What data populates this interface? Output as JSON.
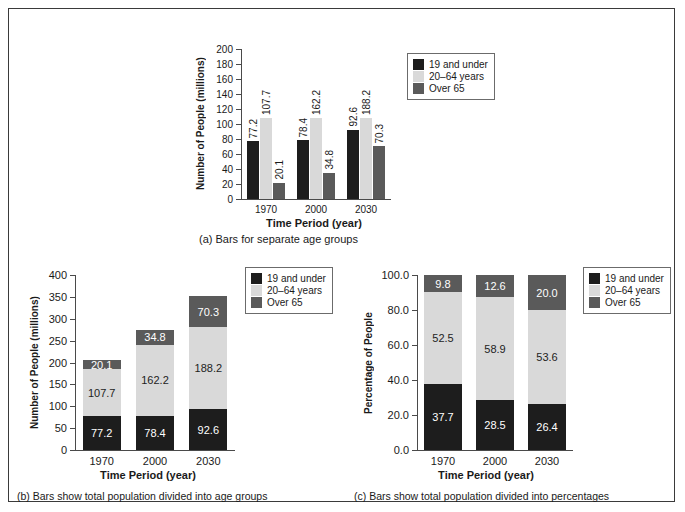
{
  "figure": {
    "panels": [
      {
        "id": "a",
        "caption": "(a) Bars for separate age groups",
        "chart_data": {
          "type": "bar",
          "title": "",
          "subtitle": "",
          "grouping": "grouped",
          "categories": [
            "1970",
            "2000",
            "2030"
          ],
          "series": [
            {
              "name": "19 and under",
              "color": "#1d1d1d",
              "values": [
                77.2,
                78.4,
                92.6
              ]
            },
            {
              "name": "20–64 years",
              "color": "#d9d9d9",
              "values": [
                107.7,
                162.2,
                188.2
              ]
            },
            {
              "name": "Over 65",
              "color": "#5a5a5a",
              "values": [
                20.1,
                34.8,
                70.3
              ]
            }
          ],
          "data_labels": [
            [
              "77.2",
              "107.7",
              "20.1"
            ],
            [
              "78.4",
              "162.2",
              "34.8"
            ],
            [
              "92.6",
              "188.2",
              "70.3"
            ]
          ],
          "xlabel": "Time Period (year)",
          "ylabel": "Number of People (millions)",
          "ylim": [
            0,
            200
          ],
          "ytick_step": 20,
          "yticks": [
            "0",
            "20",
            "40",
            "60",
            "80",
            "100",
            "120",
            "140",
            "160",
            "180",
            "200"
          ],
          "grid": false,
          "legend_position": "right"
        }
      },
      {
        "id": "b",
        "caption": "(b) Bars show total population divided into age groups",
        "chart_data": {
          "type": "bar",
          "title": "",
          "grouping": "stacked",
          "categories": [
            "1970",
            "2000",
            "2030"
          ],
          "series": [
            {
              "name": "19 and under",
              "color": "#1d1d1d",
              "values": [
                77.2,
                78.4,
                92.6
              ]
            },
            {
              "name": "20–64 years",
              "color": "#d9d9d9",
              "values": [
                107.7,
                162.2,
                188.2
              ]
            },
            {
              "name": "Over 65",
              "color": "#5a5a5a",
              "values": [
                20.1,
                34.8,
                70.3
              ]
            }
          ],
          "totals": [
            205.0,
            275.4,
            351.1
          ],
          "data_labels": [
            [
              "77.2",
              "107.7",
              "20.1"
            ],
            [
              "78.4",
              "162.2",
              "34.8"
            ],
            [
              "92.6",
              "188.2",
              "70.3"
            ]
          ],
          "xlabel": "Time Period (year)",
          "ylabel": "Number of People (millions)",
          "ylim": [
            0,
            400
          ],
          "ytick_step": 50,
          "yticks": [
            "0",
            "50",
            "100",
            "150",
            "200",
            "250",
            "300",
            "350",
            "400"
          ],
          "grid": false,
          "legend_position": "right"
        }
      },
      {
        "id": "c",
        "caption": "(c) Bars show total population divided into percentages",
        "chart_data": {
          "type": "bar",
          "title": "",
          "grouping": "stacked-percent",
          "categories": [
            "1970",
            "2000",
            "2030"
          ],
          "series": [
            {
              "name": "19 and under",
              "color": "#1d1d1d",
              "values": [
                37.7,
                28.5,
                26.4
              ]
            },
            {
              "name": "20–64 years",
              "color": "#d9d9d9",
              "values": [
                52.5,
                58.9,
                53.6
              ]
            },
            {
              "name": "Over 65",
              "color": "#5a5a5a",
              "values": [
                9.8,
                12.6,
                20.0
              ]
            }
          ],
          "data_labels": [
            [
              "37.7",
              "52.5",
              "9.8"
            ],
            [
              "28.5",
              "58.9",
              "12.6"
            ],
            [
              "26.4",
              "53.6",
              "20.0"
            ]
          ],
          "xlabel": "Time Period (year)",
          "ylabel": "Percentage of People",
          "ylim": [
            0,
            100
          ],
          "ytick_step": 20,
          "yticks": [
            "0.0",
            "20.0",
            "40.0",
            "60.0",
            "80.0",
            "100.0"
          ],
          "grid": false,
          "legend_position": "right"
        }
      }
    ],
    "legend": {
      "items": [
        {
          "label": "19 and under",
          "color": "#1d1d1d"
        },
        {
          "label": "20–64 years",
          "color": "#d9d9d9"
        },
        {
          "label": "Over 65",
          "color": "#5a5a5a"
        }
      ]
    },
    "colors": {
      "young": "#1d1d1d",
      "mid": "#d9d9d9",
      "old": "#5a5a5a",
      "axis": "#4a4a4a",
      "border": "#3a3a3a",
      "background": "#ffffff"
    }
  }
}
